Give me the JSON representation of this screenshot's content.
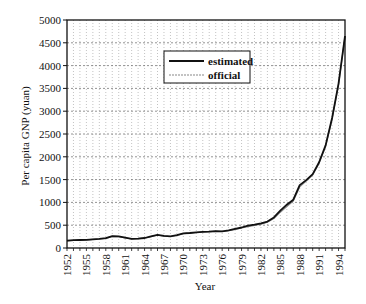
{
  "chart_data": {
    "type": "line",
    "title": "",
    "xlabel": "Year",
    "ylabel": "Per capita GNP (yuan)",
    "xlim": [
      1952,
      1995
    ],
    "ylim": [
      0,
      5000
    ],
    "grid": true,
    "legend_position": "upper-center (inside plot)",
    "x_tick_labels": [
      "1952",
      "1955",
      "1958",
      "1961",
      "1964",
      "1967",
      "1970",
      "1973",
      "1976",
      "1979",
      "1982",
      "1985",
      "1988",
      "1991",
      "1994"
    ],
    "y_tick_labels": [
      "0",
      "500",
      "1000",
      "1500",
      "2000",
      "2500",
      "3000",
      "3500",
      "4000",
      "4500",
      "5000"
    ],
    "x": [
      1952,
      1953,
      1954,
      1955,
      1956,
      1957,
      1958,
      1959,
      1960,
      1961,
      1962,
      1963,
      1964,
      1965,
      1966,
      1967,
      1968,
      1969,
      1970,
      1971,
      1972,
      1973,
      1974,
      1975,
      1976,
      1977,
      1978,
      1979,
      1980,
      1981,
      1982,
      1983,
      1984,
      1985,
      1986,
      1987,
      1988,
      1989,
      1990,
      1991,
      1992,
      1993,
      1994,
      1995
    ],
    "series": [
      {
        "name": "estimated",
        "color": "#111111",
        "values": [
          160,
          170,
          175,
          180,
          190,
          200,
          215,
          260,
          255,
          225,
          200,
          205,
          220,
          255,
          290,
          265,
          255,
          280,
          320,
          330,
          345,
          355,
          360,
          370,
          365,
          385,
          420,
          450,
          490,
          510,
          540,
          580,
          670,
          820,
          950,
          1060,
          1380,
          1490,
          1620,
          1880,
          2250,
          2850,
          3600,
          4650
        ]
      },
      {
        "name": "official",
        "color": "#888888",
        "values": [
          155,
          165,
          170,
          178,
          188,
          198,
          212,
          255,
          250,
          222,
          198,
          203,
          218,
          250,
          285,
          262,
          252,
          276,
          315,
          326,
          340,
          352,
          358,
          366,
          362,
          380,
          410,
          440,
          470,
          495,
          525,
          565,
          645,
          785,
          910,
          1030,
          1340,
          1470,
          1600,
          1860,
          2230,
          2830,
          3580,
          4640
        ]
      }
    ]
  },
  "legend": {
    "items": [
      {
        "label": "estimated",
        "color": "#111111"
      },
      {
        "label": "official",
        "color": "#888888"
      }
    ]
  }
}
